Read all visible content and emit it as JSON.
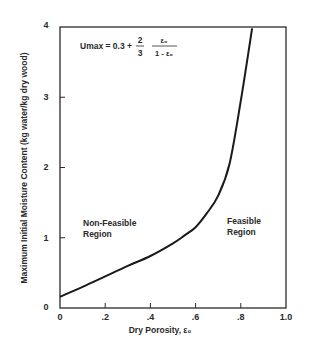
{
  "chart_data": {
    "type": "line",
    "title": "",
    "xlabel": "Dry Porosity, ε₀",
    "ylabel": "Maximum Initial Moisture Content (kg water/kg dry wood)",
    "xlim": [
      0,
      1.0
    ],
    "ylim": [
      0,
      4
    ],
    "x_ticks": [
      "0",
      ".2",
      ".4",
      ".6",
      ".8",
      "1.0"
    ],
    "y_ticks": [
      "0",
      "1",
      "2",
      "3",
      "4"
    ],
    "grid": false,
    "legend": null,
    "series": [
      {
        "name": "Umax",
        "x": [
          0,
          0.1,
          0.2,
          0.3,
          0.4,
          0.5,
          0.55,
          0.6,
          0.65,
          0.7,
          0.75,
          0.8,
          0.85
        ],
        "values": [
          0.16,
          0.3,
          0.45,
          0.6,
          0.74,
          0.92,
          1.03,
          1.15,
          1.35,
          1.6,
          2.05,
          2.95,
          3.98
        ]
      }
    ],
    "annotations": {
      "equation": {
        "lhs": "Umax = 0.3 +",
        "frac1_num": "2",
        "frac1_den": "3",
        "frac2_num": "ε₀",
        "frac2_den": "1 - ε₀"
      },
      "left_region": [
        "Non-Feasible",
        "Region"
      ],
      "right_region": [
        "Feasible",
        "Region"
      ]
    }
  }
}
